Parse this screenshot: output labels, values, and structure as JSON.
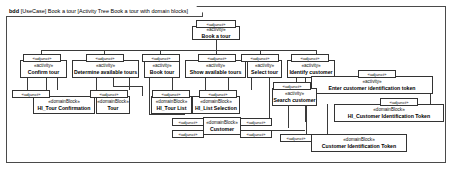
{
  "diagram": {
    "frame_label": {
      "kind": "bdd",
      "text": "[UseCase] Book a tour [Activity Tree Book a tour with domain blocks]"
    },
    "stereotypes": {
      "activity": "«activity»",
      "domain_block": "«domainBlock»",
      "adjunct": "«adjunct»"
    }
  },
  "nodes": {
    "book_a_tour": {
      "stereotype": "«activity»",
      "name": "Book a tour"
    },
    "confirm_tour": {
      "stereotype": "«activity»",
      "name": "Confirm tour"
    },
    "determine_available_tours": {
      "stereotype": "«activity»",
      "name": "Determine available tours"
    },
    "book_tour": {
      "stereotype": "«activity»",
      "name": "Book tour"
    },
    "show_available_tours": {
      "stereotype": "«activity»",
      "name": "Show available tours"
    },
    "select_tour": {
      "stereotype": "«activity»",
      "name": "Select tour"
    },
    "identify_customer": {
      "stereotype": "«activity»",
      "name": "Identify customer"
    },
    "search_customer": {
      "stereotype": "«activity»",
      "name": "Search customer"
    },
    "enter_customer_id_token": {
      "stereotype": "«activity»",
      "name": "Enter customer identification token"
    },
    "hi_tour_confirmation": {
      "stereotype": "«domainBlock»",
      "name": "HI_Tour Confirmation"
    },
    "tour": {
      "stereotype": "«domainBlock»",
      "name": "Tour"
    },
    "hi_tour_list": {
      "stereotype": "«domainBlock»",
      "name": "HI_Tour List"
    },
    "hi_list_selection": {
      "stereotype": "«domainBlock»",
      "name": "HI_List Selection"
    },
    "customer": {
      "stereotype": "«domainBlock»",
      "name": "Customer"
    },
    "hi_customer_id_token": {
      "stereotype": "«domainBlock»",
      "name": "HI_Customer Identification Token"
    },
    "customer_id_token": {
      "stereotype": "«domainBlock»",
      "name": "Customer Identification Token"
    }
  },
  "tags": {
    "t1": "«adjunct»",
    "t2": "«adjunct»",
    "t3": "«adjunct»",
    "t4": "«adjunct»",
    "t5": "«adjunct»",
    "t6": "«adjunct»",
    "t7": "«adjunct»",
    "t8": "«adjunct»",
    "t9": "«adjunct»",
    "t10": "«adjunct»",
    "t11": "«adjunct»",
    "t12": "«adjunct»",
    "t13": "«adjunct»",
    "t14": "«adjunct»",
    "t15": "«adjunct»",
    "t16": "«adjunct»",
    "t17": "«adjunct»",
    "t18": "«adjunct»"
  }
}
